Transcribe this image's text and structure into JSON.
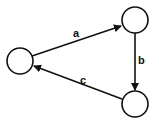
{
  "diagram": {
    "type": "directed-cycle-graph",
    "nodes": [
      {
        "id": "left",
        "cx": 20,
        "cy": 61,
        "r": 13,
        "label": ""
      },
      {
        "id": "top-right",
        "cx": 135,
        "cy": 20,
        "r": 13,
        "label": ""
      },
      {
        "id": "bottom-right",
        "cx": 135,
        "cy": 104,
        "r": 13,
        "label": ""
      }
    ],
    "edges": [
      {
        "id": "a",
        "from": "left",
        "to": "top-right",
        "label": "a"
      },
      {
        "id": "b",
        "from": "top-right",
        "to": "bottom-right",
        "label": "b"
      },
      {
        "id": "c",
        "from": "bottom-right",
        "to": "left",
        "label": "c"
      }
    ],
    "colors": {
      "stroke": "#111111",
      "background": "#ffffff"
    }
  }
}
